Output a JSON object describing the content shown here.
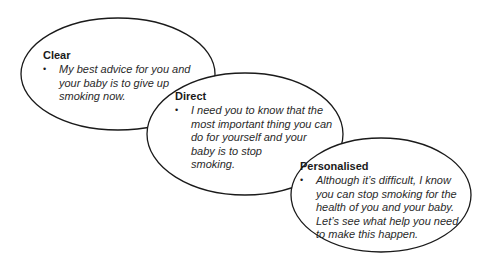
{
  "diagram": {
    "type": "overlapping-ellipses",
    "bubbles": [
      {
        "title": "Clear",
        "bullet": "•",
        "text": "My best advice for you and your baby is to give up smoking now.",
        "lines": [
          "My best advice for you and",
          "your baby is to give up",
          "smoking now."
        ]
      },
      {
        "title": "Direct",
        "bullet": "•",
        "text": "I need you to know that the most important thing you can do for yourself and your baby is to stop smoking.",
        "lines": [
          "I need you to know that the",
          "most important thing you can",
          "do for yourself and your",
          "baby is to stop",
          "smoking."
        ]
      },
      {
        "title": "Personalised",
        "bullet": "•",
        "text": "Although it’s difficult, I know you can stop smoking for the health of you and your baby. Let’s see what help you need to make this happen.",
        "lines": [
          "Although it’s difficult, I know",
          "you can stop smoking for the",
          "health of you and your baby.",
          "Let’s see what help you need",
          "to make this happen."
        ]
      }
    ],
    "colors": {
      "stroke": "#1a1a1a",
      "fill": "#ffffff",
      "text": "#1a1a1a"
    }
  }
}
